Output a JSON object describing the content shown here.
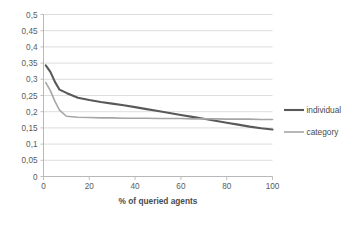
{
  "chart_data": {
    "type": "line",
    "title": "",
    "xlabel": "% of queried agents",
    "ylabel": "",
    "xlim": [
      0,
      100
    ],
    "ylim": [
      0,
      0.5
    ],
    "grid": true,
    "legend_position": "right",
    "x_ticks": [
      "0",
      "20",
      "40",
      "60",
      "80",
      "100"
    ],
    "x_tick_values": [
      0,
      20,
      40,
      60,
      80,
      100
    ],
    "y_ticks": [
      "0",
      "0,05",
      "0,1",
      "0,15",
      "0,2",
      "0,25",
      "0,3",
      "0,35",
      "0,4",
      "0,45",
      "0,5"
    ],
    "y_tick_values": [
      0,
      0.05,
      0.1,
      0.15,
      0.2,
      0.25,
      0.3,
      0.35,
      0.4,
      0.45,
      0.5
    ],
    "decimal_separator": ",",
    "series": [
      {
        "name": "individual",
        "color": "#595959",
        "width": 2.1,
        "x": [
          1,
          3,
          5,
          7,
          10,
          15,
          20,
          25,
          30,
          35,
          40,
          45,
          50,
          55,
          60,
          65,
          70,
          75,
          80,
          85,
          90,
          95,
          100
        ],
        "values": [
          0.343,
          0.323,
          0.292,
          0.268,
          0.258,
          0.243,
          0.236,
          0.23,
          0.225,
          0.22,
          0.214,
          0.208,
          0.202,
          0.196,
          0.19,
          0.184,
          0.178,
          0.172,
          0.166,
          0.16,
          0.154,
          0.149,
          0.145
        ]
      },
      {
        "name": "category",
        "color": "#a6a6a6",
        "width": 1.6,
        "x": [
          1,
          3,
          5,
          7,
          10,
          15,
          20,
          25,
          30,
          35,
          40,
          45,
          50,
          55,
          60,
          65,
          70,
          75,
          80,
          85,
          90,
          95,
          100
        ],
        "values": [
          0.29,
          0.265,
          0.232,
          0.205,
          0.186,
          0.183,
          0.182,
          0.181,
          0.181,
          0.18,
          0.18,
          0.18,
          0.179,
          0.179,
          0.179,
          0.178,
          0.178,
          0.178,
          0.177,
          0.177,
          0.177,
          0.176,
          0.176
        ]
      }
    ]
  },
  "legend": {
    "entries": [
      {
        "label": "individual"
      },
      {
        "label": "category"
      }
    ]
  },
  "colors": {
    "individual": "#595959",
    "category": "#a6a6a6",
    "gridline": "#d4d4d4",
    "axis": "#b0b0b0",
    "text": "#4a4a4a",
    "background": "#ffffff"
  }
}
